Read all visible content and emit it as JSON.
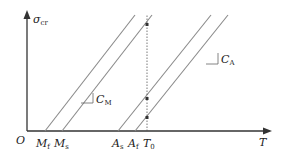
{
  "diagram": {
    "axes": {
      "y_label": "σ",
      "y_label_sub": "cr",
      "x_label": "T",
      "origin_label": "O"
    },
    "x_ticks": [
      {
        "main": "M",
        "sub": "f"
      },
      {
        "main": "M",
        "sub": "s"
      },
      {
        "main": "A",
        "sub": "s"
      },
      {
        "main": "A",
        "sub": "f"
      },
      {
        "main": "T",
        "sub": "0"
      }
    ],
    "slopes": [
      {
        "main": "C",
        "sub": "M"
      },
      {
        "main": "C",
        "sub": "A"
      }
    ],
    "colors": {
      "axis": "#333333",
      "line": "#8a8a8a",
      "dot": "#333333",
      "text": "#222222"
    }
  }
}
